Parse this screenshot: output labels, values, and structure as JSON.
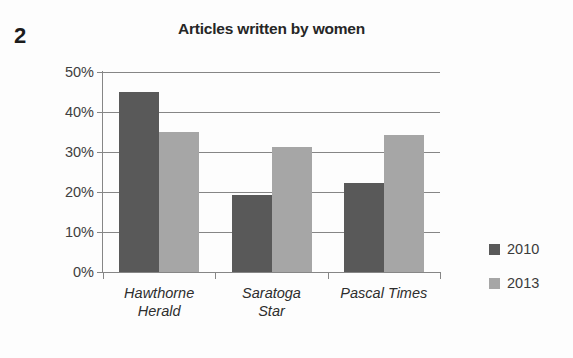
{
  "question_number": "2",
  "legend": {
    "position": "right",
    "items": [
      {
        "label": "2010",
        "color": "#595959",
        "swatch_name": "legend-swatch-2010"
      },
      {
        "label": "2013",
        "color": "#a6a6a6",
        "swatch_name": "legend-swatch-2013"
      }
    ]
  },
  "axis": {
    "y_ticks": [
      "50%",
      "40%",
      "30%",
      "20%",
      "10%",
      "0%"
    ],
    "x_labels": [
      {
        "line1": "Hawthorne",
        "line2": "Herald"
      },
      {
        "line1": "Saratoga",
        "line2": "Star"
      },
      {
        "line1": "Pascal Times",
        "line2": ""
      }
    ]
  },
  "chart_data": {
    "type": "bar",
    "title": "Articles written by women",
    "xlabel": "",
    "ylabel": "",
    "ylim": [
      0,
      50
    ],
    "ytick_values": [
      0,
      10,
      20,
      30,
      40,
      50
    ],
    "ytick_labels": [
      "0%",
      "10%",
      "20%",
      "30%",
      "40%",
      "50%"
    ],
    "grid": true,
    "grid_axis": "y",
    "legend_position": "right",
    "value_suffix": "%",
    "categories": [
      "Hawthorne Herald",
      "Saratoga Star",
      "Pascal Times"
    ],
    "series": [
      {
        "name": "2010",
        "color": "#595959",
        "values": [
          45,
          19.25,
          22.25
        ]
      },
      {
        "name": "2013",
        "color": "#a6a6a6",
        "values": [
          35,
          31.25,
          34.25
        ]
      }
    ]
  }
}
